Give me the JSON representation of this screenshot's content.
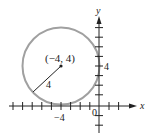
{
  "diagram": {
    "type": "circle-on-coordinate-plane",
    "axes": {
      "x_label": "x",
      "y_label": "y",
      "origin_label": "0",
      "x_tick_label": "−4",
      "y_tick_label": "4"
    },
    "circle": {
      "center_label": "(−4, 4)",
      "radius_label": "4",
      "center": [
        -4,
        4
      ],
      "radius": 4
    },
    "colors": {
      "circle": "#a0a0a0",
      "axes": "#222222"
    }
  }
}
